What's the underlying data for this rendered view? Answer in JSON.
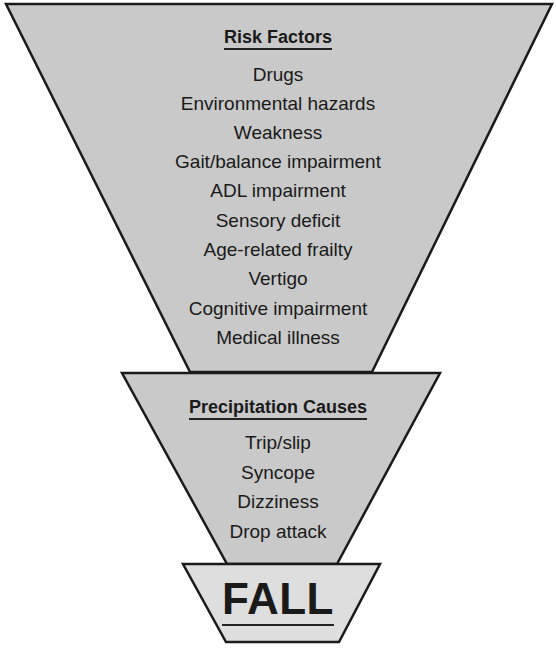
{
  "diagram": {
    "colors": {
      "stage_fill": "#c9c9c9",
      "final_fill": "#dedede",
      "stroke": "#1a1a1a",
      "text": "#1a1a1a",
      "background": "#ffffff"
    },
    "risk_factors": {
      "heading": "Risk Factors",
      "items": [
        "Drugs",
        "Environmental hazards",
        "Weakness",
        "Gait/balance impairment",
        "ADL impairment",
        "Sensory deficit",
        "Age-related frailty",
        "Vertigo",
        "Cognitive impairment",
        "Medical illness"
      ]
    },
    "precipitation_causes": {
      "heading": "Precipitation Causes",
      "items": [
        "Trip/slip",
        "Syncope",
        "Dizziness",
        "Drop attack"
      ]
    },
    "outcome": {
      "label": "FALL"
    }
  }
}
